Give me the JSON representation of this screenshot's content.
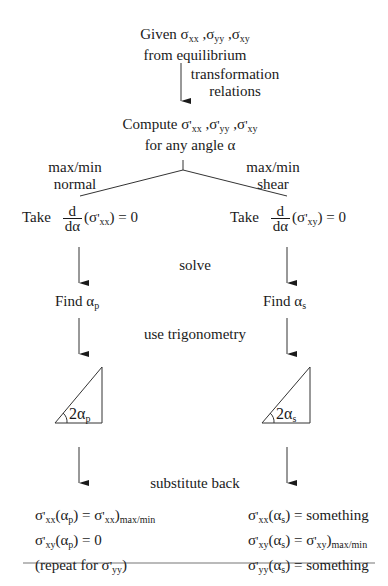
{
  "diagram": {
    "type": "flowchart",
    "top": {
      "given_label": "Given",
      "sigma": "σ",
      "sub_xx": "xx",
      "sub_yy": "yy",
      "sub_xy": "xy",
      "comma": " ,",
      "line2": "from equilibrium"
    },
    "arrow1_label": {
      "line1": "transformation",
      "line2": "relations"
    },
    "compute": {
      "label": "Compute",
      "sigma": "σ",
      "prime": "'",
      "sub_xx": "xx",
      "sub_yy": "yy",
      "sub_xy": "xy",
      "comma": " ,",
      "line2": "for any angle α"
    },
    "branches": {
      "left": {
        "line1": "max/min",
        "line2": "normal"
      },
      "right": {
        "line1": "max/min",
        "line2": "shear"
      }
    },
    "left": {
      "take": "Take",
      "frac_num": "d",
      "frac_den": "dα",
      "open": "(σ",
      "prime": "'",
      "sub": "xx",
      "close": ") = 0",
      "find": "Find α",
      "find_sub": "p",
      "triangle_label": "2α",
      "triangle_sub": "p",
      "results": [
        {
          "pre": "σ",
          "prime": "'",
          "sub": "xx",
          "arg": "(α",
          "arg_sub": "p",
          "rest": ") = σ",
          "rest_prime": "'",
          "rest_sub": "xx",
          "tail": ")",
          "tail_sub": "max/min"
        },
        {
          "pre": "σ",
          "prime": "'",
          "sub": "xy",
          "arg": "(α",
          "arg_sub": "p",
          "rest": ") = 0"
        },
        {
          "text": "(repeat for σ",
          "prime": "'",
          "sub": "yy",
          "close": ")"
        }
      ]
    },
    "right": {
      "take": "Take",
      "frac_num": "d",
      "frac_den": "dα",
      "open": "(σ",
      "prime": "'",
      "sub": "xy",
      "close": ") = 0",
      "find": "Find α",
      "find_sub": "s",
      "triangle_label": "2α",
      "triangle_sub": "s",
      "results": [
        {
          "pre": "σ",
          "prime": "'",
          "sub": "xx",
          "arg": "(α",
          "arg_sub": "s",
          "rest": ") = something"
        },
        {
          "pre": "σ",
          "prime": "'",
          "sub": "xy",
          "arg": "(α",
          "arg_sub": "s",
          "rest": ") = σ",
          "rest_prime": "'",
          "rest_sub": "xy",
          "tail": ")",
          "tail_sub": "max/min"
        },
        {
          "pre": "σ",
          "prime": "'",
          "sub": "yy",
          "arg": "(α",
          "arg_sub": "s",
          "rest": ") = something"
        }
      ]
    },
    "middle_labels": {
      "solve": "solve",
      "trig": "use trigonometry",
      "substitute": "substitute back"
    }
  }
}
